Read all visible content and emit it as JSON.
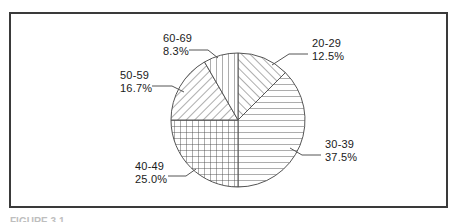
{
  "figure": {
    "background_color": "#ffffff",
    "frame_color": "#3a3a3a",
    "line_color": "#555555",
    "text_color": "#1a1a1a",
    "caption_partial": "FIGURE 3.1"
  },
  "chart_data": {
    "type": "pie",
    "title": "",
    "xlabel": "",
    "ylabel": "",
    "legend_position": "none",
    "grid": false,
    "start_angle_deg": 90,
    "direction": "clockwise",
    "center": {
      "x": 238,
      "y": 120
    },
    "radius": 67,
    "categories": [
      "20-29",
      "30-39",
      "40-49",
      "50-59",
      "60-69"
    ],
    "values": [
      12.5,
      37.5,
      25.0,
      16.7,
      8.3
    ],
    "value_suffix": "%",
    "slices": [
      {
        "label": "20-29",
        "percent_text": "12.5%",
        "value": 12.5,
        "start_deg": 0,
        "sweep_deg": 45,
        "pattern": "diagonal-up-hatch",
        "label_x": 312,
        "label_y": 47,
        "percent_x": 312,
        "percent_y": 60,
        "leader": "M 308 54 L 289 54 L 272 65"
      },
      {
        "label": "30-39",
        "percent_text": "37.5%",
        "value": 37.5,
        "start_deg": 45,
        "sweep_deg": 135,
        "pattern": "horizontal-lines",
        "label_x": 325,
        "label_y": 148,
        "percent_x": 325,
        "percent_y": 161,
        "leader": "M 321 155 L 302 155 L 290 148"
      },
      {
        "label": "40-49",
        "percent_text": "25.0%",
        "value": 25.0,
        "start_deg": 180,
        "sweep_deg": 90,
        "pattern": "cross-hatch",
        "label_x": 135,
        "label_y": 170,
        "percent_x": 135,
        "percent_y": 183,
        "leader": "M 168 176 L 186 176 L 196 169"
      },
      {
        "label": "50-59",
        "percent_text": "16.7%",
        "value": 16.7,
        "start_deg": 270,
        "sweep_deg": 60,
        "pattern": "diagonal-down-hatch",
        "label_x": 120,
        "label_y": 79,
        "percent_x": 120,
        "percent_y": 92,
        "leader": "M 152 86 L 172 86 L 184 92"
      },
      {
        "label": "60-69",
        "percent_text": "8.3%",
        "value": 8.3,
        "start_deg": 330,
        "sweep_deg": 30,
        "pattern": "vertical-lines",
        "label_x": 163,
        "label_y": 42,
        "percent_x": 163,
        "percent_y": 55,
        "leader": "M 189 50 L 208 50 L 218 58"
      }
    ]
  }
}
